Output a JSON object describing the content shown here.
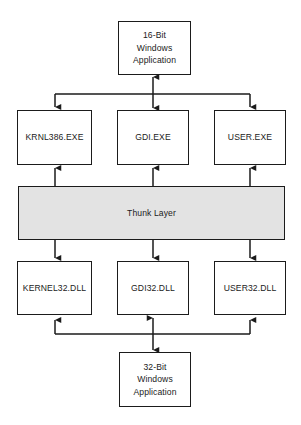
{
  "diagram": {
    "colors": {
      "background": "#ffffff",
      "stroke": "#1b1b1b",
      "node_fill": "#ffffff",
      "band_fill": "#e3e3e3"
    },
    "nodes": {
      "app16": {
        "id": "16-bit-windows-application",
        "lines": [
          "16-Bit",
          "Windows",
          "Application"
        ]
      },
      "krnl386": {
        "id": "krnl386-exe",
        "label": "KRNL386.EXE"
      },
      "gdiexe": {
        "id": "gdi-exe",
        "label": "GDI.EXE"
      },
      "userexe": {
        "id": "user-exe",
        "label": "USER.EXE"
      },
      "thunk": {
        "id": "thunk-layer",
        "label": "Thunk Layer"
      },
      "kernel32": {
        "id": "kernel32-dll",
        "label": "KERNEL32.DLL"
      },
      "gdi32": {
        "id": "gdi32-dll",
        "label": "GDI32.DLL"
      },
      "user32": {
        "id": "user32-dll",
        "label": "USER32.DLL"
      },
      "app32": {
        "id": "32-bit-windows-application",
        "lines": [
          "32-Bit",
          "Windows",
          "Application"
        ]
      }
    },
    "connectors": [
      {
        "id": "app16-to-bus",
        "from": "app16",
        "to": "top-bus",
        "arrows": "both"
      },
      {
        "id": "bus-to-krnl386",
        "from": "top-bus",
        "to": "krnl386",
        "arrows": "end"
      },
      {
        "id": "bus-to-userexe",
        "from": "top-bus",
        "to": "userexe",
        "arrows": "end"
      },
      {
        "id": "thunk-to-krnl386",
        "from": "thunk",
        "to": "krnl386",
        "arrows": "end"
      },
      {
        "id": "thunk-to-gdiexe",
        "from": "thunk",
        "to": "gdiexe",
        "arrows": "end"
      },
      {
        "id": "thunk-to-userexe",
        "from": "thunk",
        "to": "userexe",
        "arrows": "end"
      },
      {
        "id": "thunk-to-kernel32",
        "from": "thunk",
        "to": "kernel32",
        "arrows": "end"
      },
      {
        "id": "thunk-to-gdi32",
        "from": "thunk",
        "to": "gdi32",
        "arrows": "end"
      },
      {
        "id": "thunk-to-user32",
        "from": "thunk",
        "to": "user32",
        "arrows": "end"
      },
      {
        "id": "bottom-bus-to-kernel32",
        "from": "bottom-bus",
        "to": "kernel32",
        "arrows": "end"
      },
      {
        "id": "bottom-bus-to-user32",
        "from": "bottom-bus",
        "to": "user32",
        "arrows": "end"
      },
      {
        "id": "app32-to-bottom-bus",
        "from": "app32",
        "to": "bottom-bus",
        "arrows": "both"
      }
    ]
  }
}
